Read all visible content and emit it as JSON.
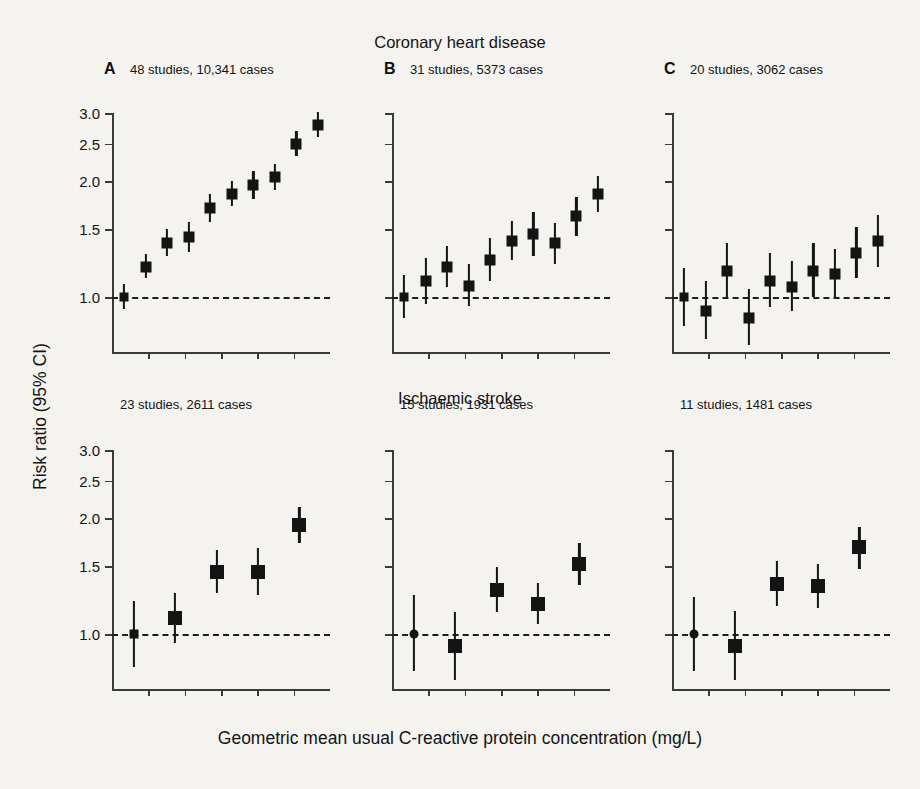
{
  "axes": {
    "ylabel": "Risk ratio (95% CI)",
    "xlabel": "Geometric mean usual C-reactive protein concentration (mg/L)",
    "ytick_labels": [
      "3.0",
      "2.5",
      "2.0",
      "1.5",
      "1.0"
    ],
    "ytick_values": [
      3.0,
      2.5,
      2.0,
      1.5,
      1.0
    ],
    "reference_line_value": 1.0,
    "scale": "log",
    "ylim": [
      0.72,
      3.25
    ],
    "n_xticks": 5,
    "grid": false
  },
  "rows": [
    {
      "title": "Coronary heart disease"
    },
    {
      "title": "Ischaemic stroke"
    }
  ],
  "panels": [
    {
      "letter": "A",
      "caption": "48 studies, 10,341 cases",
      "row": "Coronary heart disease"
    },
    {
      "letter": "B",
      "caption": "31 studies, 5373 cases",
      "row": "Coronary heart disease"
    },
    {
      "letter": "C",
      "caption": "20 studies, 3062 cases",
      "row": "Coronary heart disease"
    },
    {
      "letter": "",
      "caption": "23 studies, 2611 cases",
      "row": "Ischaemic stroke"
    },
    {
      "letter": "",
      "caption": "15 studies, 1931 cases",
      "row": "Ischaemic stroke"
    },
    {
      "letter": "",
      "caption": "11 studies, 1481 cases",
      "row": "Ischaemic stroke"
    }
  ],
  "chart_data": {
    "type": "scatter",
    "xlabel": "Geometric mean usual C-reactive protein concentration (mg/L)",
    "ylabel": "Risk ratio (95% CI)",
    "ylim": [
      0.72,
      3.25
    ],
    "yscale": "log",
    "ytick_labels": [
      "1.0",
      "1.5",
      "2.0",
      "2.5",
      "3.0"
    ],
    "reference_line": 1.0,
    "marker": "filled-square-with-error-bars",
    "color": "#141414",
    "legend": "none",
    "panels": [
      {
        "id": "A",
        "row": "Coronary heart disease",
        "caption": "48 studies, 10,341 cases",
        "points": [
          {
            "x": 1,
            "rr": 1.0,
            "lo": 0.93,
            "hi": 1.08
          },
          {
            "x": 2,
            "rr": 1.2,
            "lo": 1.12,
            "hi": 1.29
          },
          {
            "x": 3,
            "rr": 1.38,
            "lo": 1.28,
            "hi": 1.5
          },
          {
            "x": 4,
            "rr": 1.43,
            "lo": 1.31,
            "hi": 1.57
          },
          {
            "x": 5,
            "rr": 1.7,
            "lo": 1.57,
            "hi": 1.85
          },
          {
            "x": 6,
            "rr": 1.85,
            "lo": 1.72,
            "hi": 2.0
          },
          {
            "x": 7,
            "rr": 1.95,
            "lo": 1.8,
            "hi": 2.12
          },
          {
            "x": 8,
            "rr": 2.05,
            "lo": 1.9,
            "hi": 2.22
          },
          {
            "x": 9,
            "rr": 2.5,
            "lo": 2.32,
            "hi": 2.7
          },
          {
            "x": 10,
            "rr": 2.8,
            "lo": 2.6,
            "hi": 3.02
          }
        ]
      },
      {
        "id": "B",
        "row": "Coronary heart disease",
        "caption": "31 studies, 5373 cases",
        "points": [
          {
            "x": 1,
            "rr": 1.0,
            "lo": 0.88,
            "hi": 1.14
          },
          {
            "x": 2,
            "rr": 1.1,
            "lo": 0.96,
            "hi": 1.26
          },
          {
            "x": 3,
            "rr": 1.2,
            "lo": 1.06,
            "hi": 1.36
          },
          {
            "x": 4,
            "rr": 1.07,
            "lo": 0.95,
            "hi": 1.22
          },
          {
            "x": 5,
            "rr": 1.25,
            "lo": 1.1,
            "hi": 1.42
          },
          {
            "x": 6,
            "rr": 1.4,
            "lo": 1.25,
            "hi": 1.58
          },
          {
            "x": 7,
            "rr": 1.46,
            "lo": 1.28,
            "hi": 1.66
          },
          {
            "x": 8,
            "rr": 1.38,
            "lo": 1.22,
            "hi": 1.56
          },
          {
            "x": 9,
            "rr": 1.62,
            "lo": 1.44,
            "hi": 1.82
          },
          {
            "x": 10,
            "rr": 1.85,
            "lo": 1.66,
            "hi": 2.06
          }
        ]
      },
      {
        "id": "C",
        "row": "Coronary heart disease",
        "caption": "20 studies, 3062 cases",
        "points": [
          {
            "x": 1,
            "rr": 1.0,
            "lo": 0.84,
            "hi": 1.19
          },
          {
            "x": 2,
            "rr": 0.92,
            "lo": 0.78,
            "hi": 1.1
          },
          {
            "x": 3,
            "rr": 1.17,
            "lo": 1.0,
            "hi": 1.38
          },
          {
            "x": 4,
            "rr": 0.88,
            "lo": 0.75,
            "hi": 1.05
          },
          {
            "x": 5,
            "rr": 1.1,
            "lo": 0.94,
            "hi": 1.3
          },
          {
            "x": 6,
            "rr": 1.06,
            "lo": 0.92,
            "hi": 1.24
          },
          {
            "x": 7,
            "rr": 1.17,
            "lo": 1.0,
            "hi": 1.38
          },
          {
            "x": 8,
            "rr": 1.15,
            "lo": 1.0,
            "hi": 1.33
          },
          {
            "x": 9,
            "rr": 1.3,
            "lo": 1.12,
            "hi": 1.52
          },
          {
            "x": 10,
            "rr": 1.4,
            "lo": 1.2,
            "hi": 1.63
          }
        ]
      },
      {
        "id": "D",
        "row": "Ischaemic stroke",
        "caption": "23 studies, 2611 cases",
        "points": [
          {
            "x": 1,
            "rr": 1.0,
            "lo": 0.82,
            "hi": 1.22
          },
          {
            "x": 2,
            "rr": 1.1,
            "lo": 0.95,
            "hi": 1.28
          },
          {
            "x": 3,
            "rr": 1.45,
            "lo": 1.28,
            "hi": 1.65
          },
          {
            "x": 4,
            "rr": 1.45,
            "lo": 1.26,
            "hi": 1.67
          },
          {
            "x": 5,
            "rr": 1.92,
            "lo": 1.72,
            "hi": 2.14
          }
        ]
      },
      {
        "id": "E",
        "row": "Ischaemic stroke",
        "caption": "15 studies, 1931 cases",
        "points": [
          {
            "x": 1,
            "rr": 1.0,
            "lo": 0.8,
            "hi": 1.26
          },
          {
            "x": 2,
            "rr": 0.93,
            "lo": 0.76,
            "hi": 1.14
          },
          {
            "x": 3,
            "rr": 1.3,
            "lo": 1.14,
            "hi": 1.49
          },
          {
            "x": 4,
            "rr": 1.2,
            "lo": 1.06,
            "hi": 1.36
          },
          {
            "x": 5,
            "rr": 1.52,
            "lo": 1.34,
            "hi": 1.72
          }
        ]
      },
      {
        "id": "F",
        "row": "Ischaemic stroke",
        "caption": "11 studies, 1481 cases",
        "points": [
          {
            "x": 1,
            "rr": 1.0,
            "lo": 0.8,
            "hi": 1.25
          },
          {
            "x": 2,
            "rr": 0.93,
            "lo": 0.76,
            "hi": 1.15
          },
          {
            "x": 3,
            "rr": 1.35,
            "lo": 1.18,
            "hi": 1.55
          },
          {
            "x": 4,
            "rr": 1.33,
            "lo": 1.17,
            "hi": 1.52
          },
          {
            "x": 5,
            "rr": 1.68,
            "lo": 1.48,
            "hi": 1.9
          }
        ]
      }
    ]
  }
}
